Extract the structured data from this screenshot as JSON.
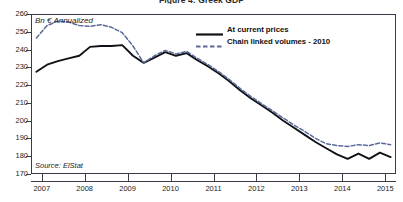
{
  "figure": {
    "title": "Figure 4: Greek GDP",
    "unit_label": "Bn € Annualized",
    "source_label": "Source: ElStat"
  },
  "legend": {
    "position": "top-right",
    "items": [
      {
        "label": "At current prices",
        "style": "solid",
        "color": "#111118",
        "name": "legend-item-current-prices"
      },
      {
        "label": "Chain linked volumes - 2010",
        "style": "dashed",
        "color": "#5a6a9a",
        "name": "legend-item-chain-linked"
      }
    ]
  },
  "chart_data": {
    "type": "line",
    "title": "Figure 4: Greek GDP",
    "xlabel": "",
    "ylabel": "Bn € Annualized",
    "ylim": [
      170,
      260
    ],
    "ytick_labels": [
      "260",
      "250",
      "240",
      "230",
      "220",
      "210",
      "200",
      "190",
      "180",
      "170"
    ],
    "ytick_values": [
      260,
      250,
      240,
      230,
      220,
      210,
      200,
      190,
      180,
      170
    ],
    "xlim": [
      2006.75,
      2015.25
    ],
    "xtick_labels": [
      "2007",
      "2008",
      "2009",
      "2010",
      "2011",
      "2012",
      "2013",
      "2014",
      "2015"
    ],
    "xtick_values": [
      2007,
      2008,
      2009,
      2010,
      2011,
      2012,
      2013,
      2014,
      2015
    ],
    "grid": false,
    "annotations": [
      {
        "text": "Bn € Annualized",
        "x": 2006.95,
        "y": 258
      },
      {
        "text": "Source: ElStat",
        "x": 2006.95,
        "y": 176
      }
    ],
    "x": [
      2006.875,
      2007.125,
      2007.375,
      2007.625,
      2007.875,
      2008.125,
      2008.375,
      2008.625,
      2008.875,
      2009.125,
      2009.375,
      2009.625,
      2009.875,
      2010.125,
      2010.375,
      2010.625,
      2010.875,
      2011.125,
      2011.375,
      2011.625,
      2011.875,
      2012.125,
      2012.375,
      2012.625,
      2012.875,
      2013.125,
      2013.375,
      2013.625,
      2013.875,
      2014.125,
      2014.375,
      2014.625,
      2014.875,
      2015.125
    ],
    "series": [
      {
        "name": "At current prices",
        "color": "#111118",
        "style": "solid",
        "values": [
          227.5,
          231.5,
          233.5,
          235.0,
          236.5,
          241.5,
          242.0,
          242.0,
          242.5,
          236.5,
          232.5,
          235.5,
          238.5,
          236.5,
          238.0,
          234.0,
          230.5,
          226.5,
          222.0,
          217.0,
          212.5,
          208.5,
          204.5,
          200.0,
          196.0,
          192.0,
          188.0,
          184.5,
          181.0,
          178.5,
          181.5,
          178.5,
          182.0,
          179.5
        ]
      },
      {
        "name": "Chain linked volumes - 2010",
        "color": "#5a6a9a",
        "style": "dashed",
        "values": [
          246.5,
          253.5,
          256.0,
          255.5,
          253.5,
          253.0,
          254.0,
          252.5,
          249.5,
          242.0,
          232.5,
          236.5,
          239.5,
          237.5,
          239.0,
          235.0,
          231.5,
          227.5,
          223.0,
          218.0,
          213.5,
          209.5,
          205.5,
          201.5,
          197.5,
          194.0,
          190.0,
          187.0,
          186.0,
          185.5,
          186.5,
          186.0,
          187.5,
          186.5
        ]
      }
    ]
  }
}
